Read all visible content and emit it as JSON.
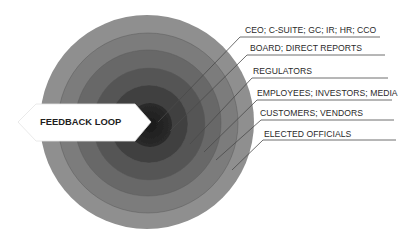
{
  "diagram": {
    "type": "concentric-stakeholder-rings",
    "center_label": "FEEDBACK LOOP",
    "rings": [
      {
        "level": 1,
        "label": "CEO; C-SUITE; GC; IR; HR; CCO",
        "color": "#2b2b2b"
      },
      {
        "level": 2,
        "label": "BOARD; DIRECT REPORTS",
        "color": "#3f3f3f"
      },
      {
        "level": 3,
        "label": "REGULATORS",
        "color": "#525252"
      },
      {
        "level": 4,
        "label": "EMPLOYEES; INVESTORS; MEDIA",
        "color": "#666666"
      },
      {
        "level": 5,
        "label": "CUSTOMERS; VENDORS",
        "color": "#797979"
      },
      {
        "level": 6,
        "label": "ELECTED OFFICIALS",
        "color": "#8c8c8c"
      }
    ]
  },
  "colors": {
    "background": "#ffffff",
    "arrow_fill": "#ffffff",
    "text": "#2a2a2a",
    "leader_line": "#555555"
  }
}
